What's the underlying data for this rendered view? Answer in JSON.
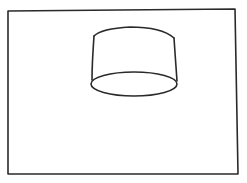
{
  "drawing": {
    "description": "Hand-drawn sketch of a cylinder / lampshade shape inside a rectangular frame",
    "colors": {
      "background": "#ffffff",
      "stroke": "#2a2a2a"
    },
    "frame": {
      "points": "8,11 120,10 235,9 238,174 120,174 8,174"
    },
    "cylinder": {
      "top_edge": "M 94 36 C 100 30, 112 28, 130 27 C 150 27, 166 31, 174 38",
      "left_side": "M 94 36 C 93 50, 92 66, 92 80",
      "right_side": "M 174 38 C 175 52, 176 68, 177 81",
      "bottom_ellipse": {
        "cx": 134,
        "cy": 84,
        "rx": 43,
        "ry": 12
      }
    }
  }
}
